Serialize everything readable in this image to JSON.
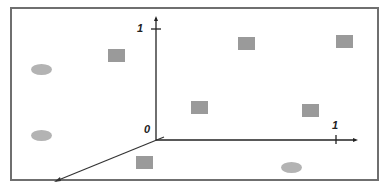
{
  "diagram": {
    "type": "3d-axes-with-points",
    "colors": {
      "frame": "#6f6f6f",
      "axis": "#222222",
      "square": "#9a9a9a",
      "ellipse": "#b3b3b3"
    },
    "axis_labels": {
      "origin": "0",
      "y_tick": "1",
      "x_tick": "1"
    },
    "squares": [
      {
        "x": 108,
        "y": 49
      },
      {
        "x": 238,
        "y": 37
      },
      {
        "x": 336,
        "y": 35
      },
      {
        "x": 191,
        "y": 101
      },
      {
        "x": 302,
        "y": 104
      },
      {
        "x": 136,
        "y": 156
      }
    ],
    "ellipses": [
      {
        "cx": 41,
        "cy": 69
      },
      {
        "cx": 41,
        "cy": 135
      },
      {
        "cx": 291,
        "cy": 167
      }
    ]
  }
}
